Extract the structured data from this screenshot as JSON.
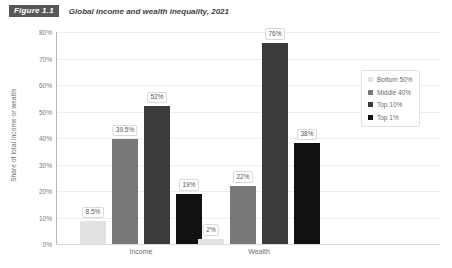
{
  "figure": {
    "badge": "Figure 1.1",
    "title": "Global income and wealth inequality, 2021"
  },
  "legend": {
    "items": [
      {
        "label": "Bottom 50%",
        "color": "#e2e2e2"
      },
      {
        "label": "Middle 40%",
        "color": "#787878"
      },
      {
        "label": "Top 10%",
        "color": "#3b3b3b"
      },
      {
        "label": "Top 1%",
        "color": "#111111"
      }
    ]
  },
  "chart_data": {
    "type": "bar",
    "title": "Global income and wealth inequality, 2021",
    "xlabel": "",
    "ylabel": "Share of total income or wealth",
    "categories": [
      "Income",
      "Wealth"
    ],
    "series": [
      {
        "name": "Bottom 50%",
        "color": "#e2e2e2",
        "values": [
          8.5,
          2
        ],
        "labels": [
          "8.5%",
          "2%"
        ]
      },
      {
        "name": "Middle 40%",
        "color": "#787878",
        "values": [
          39.5,
          22
        ],
        "labels": [
          "39.5%",
          "22%"
        ]
      },
      {
        "name": "Top 10%",
        "color": "#3b3b3b",
        "values": [
          52,
          76
        ],
        "labels": [
          "52%",
          "76%"
        ]
      },
      {
        "name": "Top 1%",
        "color": "#111111",
        "values": [
          19,
          38
        ],
        "labels": [
          "19%",
          "38%"
        ]
      }
    ],
    "ylim": [
      0,
      80
    ],
    "yticks": [
      0,
      10,
      20,
      30,
      40,
      50,
      60,
      70,
      80
    ],
    "ytick_labels": [
      "0%",
      "10%",
      "20%",
      "30%",
      "40%",
      "50%",
      "60%",
      "70%",
      "80%"
    ],
    "grid": true,
    "legend_position": "top-right"
  }
}
